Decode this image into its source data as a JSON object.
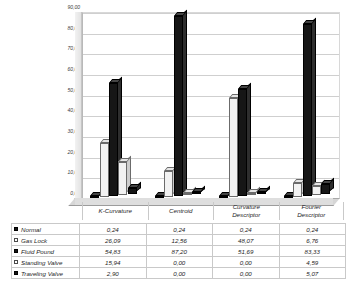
{
  "chart_data": {
    "type": "bar",
    "title": "",
    "xlabel": "",
    "ylabel": "",
    "ylim": [
      0,
      90
    ],
    "ytick_step": 10,
    "grid": true,
    "legend_position": "data-table",
    "categories": [
      "K-Curvature",
      "Centroid",
      "Curvature Descriptor",
      "Fourier Descriptor"
    ],
    "ytick_labels": [
      "90,00",
      "80,00",
      "70,00",
      "60,00",
      "50,00",
      "40,00",
      "30,00",
      "20,00",
      "10,00",
      "0,00"
    ],
    "ytick_values": [
      90,
      80,
      70,
      60,
      50,
      40,
      30,
      20,
      10,
      0
    ],
    "series": [
      {
        "name": "Normal",
        "marker": "filled-square",
        "color": "#151515",
        "values": [
          0.24,
          0.24,
          0.24,
          0.24
        ],
        "labels": [
          "0,24",
          "0,24",
          "0,24",
          "0,24"
        ]
      },
      {
        "name": "Gas Lock",
        "marker": "hollow-square",
        "color": "#ffffff",
        "values": [
          26.09,
          12.56,
          48.07,
          6.76
        ],
        "labels": [
          "26,09",
          "12,56",
          "48,07",
          "6,76"
        ]
      },
      {
        "name": "Fluid Pound",
        "marker": "filled-square",
        "color": "#151515",
        "values": [
          54.83,
          87.2,
          51.69,
          83.33
        ],
        "labels": [
          "54,83",
          "87,20",
          "51,69",
          "83,33"
        ]
      },
      {
        "name": "Standing Valve",
        "marker": "hollow-square",
        "color": "#ffffff",
        "values": [
          15.94,
          0.0,
          0.0,
          4.59
        ],
        "labels": [
          "15,94",
          "0,00",
          "0,00",
          "4,59"
        ]
      },
      {
        "name": "Traveling Valve",
        "marker": "filled-square",
        "color": "#151515",
        "values": [
          2.9,
          0.0,
          0.0,
          5.07
        ],
        "labels": [
          "2,90",
          "0,00",
          "0,00",
          "5,07"
        ]
      }
    ]
  }
}
